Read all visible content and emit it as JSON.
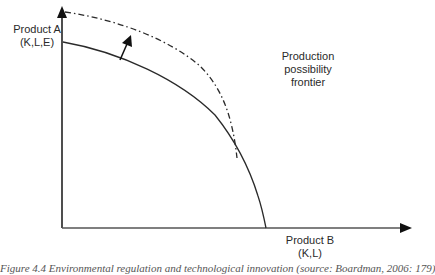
{
  "diagram": {
    "title": "Production possibility frontier",
    "y_axis": {
      "label_line1": "Product A",
      "label_line2": "(K,L,E)"
    },
    "x_axis": {
      "label_line1": "Product B",
      "label_line2": "(K,L)"
    },
    "curve_label": {
      "line1": "Production",
      "line2": "possibility",
      "line3": "frontier"
    },
    "curves": [
      {
        "name": "original-frontier",
        "style": "solid",
        "color": "#2a2a2a"
      },
      {
        "name": "shifted-frontier",
        "style": "dash-dot",
        "color": "#2a2a2a"
      }
    ],
    "shift_arrow": {
      "direction": "outward",
      "color": "#111111"
    },
    "caption": "Figure 4.4 Environmental regulation and technological innovation (source: Boardman, 2006: 179)"
  }
}
